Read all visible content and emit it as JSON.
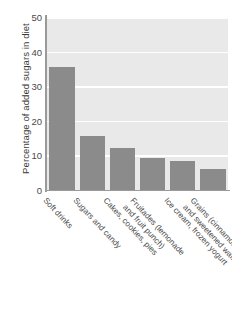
{
  "chart_data": {
    "type": "bar",
    "title": "",
    "xlabel": "",
    "ylabel": "Percentage of added sugars in diet",
    "ylim": [
      0,
      50
    ],
    "ytick_labels": [
      "50",
      "40",
      "30",
      "20",
      "10",
      "0"
    ],
    "ytick_values": [
      50,
      40,
      30,
      20,
      10,
      0
    ],
    "grid": true,
    "grid_axis": "y",
    "legend": "none",
    "bar_color": "#8b8b8b",
    "plot_background": "#e9e9e9",
    "categories": [
      "Soft drinks",
      "Sugars and candy",
      "Cakes, cookies, pies",
      "Fruitades (lemonade\nand fruit punch)",
      "Ice cream, frozen yogurt",
      "Grains (cinnamon toast\nand sweetened waffles)"
    ],
    "values": [
      35.5,
      15.5,
      12.0,
      9.3,
      8.4,
      6.1
    ]
  }
}
